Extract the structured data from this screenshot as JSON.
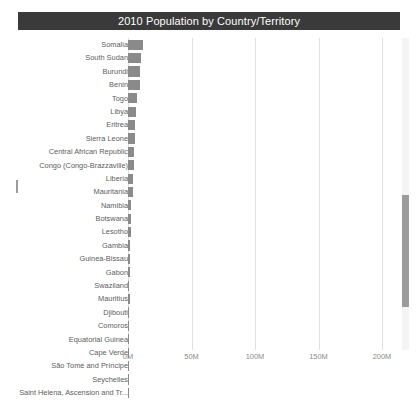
{
  "window": {
    "title": "2010 Population by Country/Territory"
  },
  "axis": {
    "ticks": [
      "0M",
      "50M",
      "100M",
      "150M",
      "200M"
    ],
    "tick_values": [
      0,
      50000000,
      100000000,
      150000000,
      200000000
    ],
    "xlabel": "",
    "ylabel": ""
  },
  "scrollbar": {
    "vertical_name": "vertical-scrollbar",
    "thumb_name": "vertical-scrollbar-thumb"
  },
  "colors": {
    "title_bar_bg": "#3a3a3a",
    "title_text": "#ffffff",
    "bar": "#8a8a8a",
    "gridline": "#dfdfdf",
    "label_text": "#5d5d5d",
    "tick_text": "#8a8a8a",
    "scrollbar_track": "#f4f4f4",
    "scrollbar_thumb": "#9b9b9b",
    "background": "#ffffff"
  },
  "chart_data": {
    "type": "bar",
    "orientation": "horizontal",
    "title": "2010 Population by Country/Territory",
    "xlabel": "",
    "ylabel": "",
    "xlim": [
      0,
      212000000
    ],
    "grid": true,
    "legend": false,
    "axis_tick_labels": [
      "0M",
      "50M",
      "100M",
      "150M",
      "200M"
    ],
    "categories": [
      "Somalia",
      "South Sudan",
      "Burundi",
      "Benin",
      "Togo",
      "Libya",
      "Eritrea",
      "Sierra Leone",
      "Central African Republic",
      "Congo (Congo-Brazzaville)",
      "Liberia",
      "Mauritania",
      "Namibia",
      "Botswana",
      "Lesotho",
      "Gambia",
      "Guinea-Bissau",
      "Gabon",
      "Swaziland",
      "Mauritius",
      "Djibouti",
      "Comoros",
      "Equatorial Guinea",
      "Cape Verde",
      "São Tomé and Príncipe",
      "Seychelles",
      "Saint Helena, Ascension and Tr..."
    ],
    "values": [
      12000000,
      10000000,
      9500000,
      9200000,
      6800000,
      6200000,
      5700000,
      5700000,
      4400000,
      4400000,
      3900000,
      3600000,
      2200000,
      2000000,
      2000000,
      1700000,
      1600000,
      1600000,
      1100000,
      1200000,
      900000,
      700000,
      700000,
      500000,
      180000,
      90000,
      5000
    ],
    "value_labels": [
      "12M",
      "10M",
      "9.5M",
      "9.2M",
      "6.8M",
      "6.2M",
      "5.7M",
      "5.7M",
      "4.4M",
      "4.4M",
      "3.9M",
      "3.6M",
      "2.2M",
      "2.0M",
      "2.0M",
      "1.7M",
      "1.6M",
      "1.6M",
      "1.1M",
      "1.2M",
      "0.9M",
      "0.7M",
      "0.7M",
      "0.5M",
      "0.18M",
      "0.09M",
      "0.005M"
    ]
  }
}
